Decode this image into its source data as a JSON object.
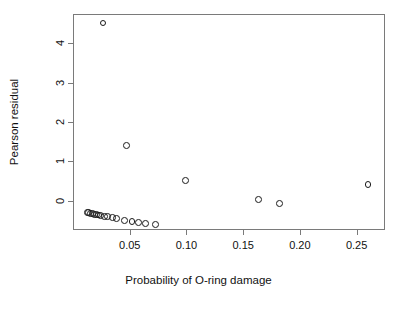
{
  "chart_data": {
    "type": "scatter",
    "title": "",
    "xlabel": "Probability of O-ring damage",
    "ylabel": "Pearson residual",
    "xlim": [
      0.0,
      0.275
    ],
    "ylim": [
      -0.75,
      4.75
    ],
    "xticks": [
      0.05,
      0.1,
      0.15,
      0.2,
      0.25
    ],
    "xticklabels": [
      "0.05",
      "0.10",
      "0.15",
      "0.20",
      "0.25"
    ],
    "yticks": [
      0,
      1,
      2,
      3,
      4
    ],
    "yticklabels": [
      "0",
      "1",
      "2",
      "3",
      "4"
    ],
    "grid": false,
    "legend": null,
    "marker": "open-circle",
    "marker_color": "#1a1a1a",
    "points": [
      {
        "x": 0.0265,
        "y": 4.52
      },
      {
        "x": 0.047,
        "y": 1.4
      },
      {
        "x": 0.0995,
        "y": 0.52
      },
      {
        "x": 0.1635,
        "y": 0.03
      },
      {
        "x": 0.182,
        "y": -0.08
      },
      {
        "x": 0.26,
        "y": 0.4
      },
      {
        "x": 0.0125,
        "y": -0.3
      },
      {
        "x": 0.014,
        "y": -0.31
      },
      {
        "x": 0.0155,
        "y": -0.32
      },
      {
        "x": 0.017,
        "y": -0.33
      },
      {
        "x": 0.019,
        "y": -0.35
      },
      {
        "x": 0.0205,
        "y": -0.36
      },
      {
        "x": 0.0225,
        "y": -0.37
      },
      {
        "x": 0.0245,
        "y": -0.38
      },
      {
        "x": 0.028,
        "y": -0.4
      },
      {
        "x": 0.0305,
        "y": -0.41
      },
      {
        "x": 0.0345,
        "y": -0.44
      },
      {
        "x": 0.0385,
        "y": -0.46
      },
      {
        "x": 0.0455,
        "y": -0.5
      },
      {
        "x": 0.052,
        "y": -0.53
      },
      {
        "x": 0.058,
        "y": -0.55
      },
      {
        "x": 0.064,
        "y": -0.58
      },
      {
        "x": 0.0725,
        "y": -0.6
      }
    ]
  }
}
